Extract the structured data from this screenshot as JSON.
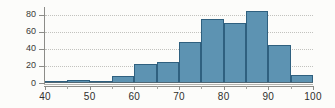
{
  "chart_data": {
    "type": "bar",
    "title": "",
    "subtitle": "",
    "xlabel": "",
    "ylabel": "",
    "xlim": [
      40,
      100
    ],
    "ylim": [
      0,
      88
    ],
    "grid": true,
    "legend": null,
    "bin_width": 5,
    "bin_edges": [
      40,
      45,
      50,
      55,
      60,
      65,
      70,
      75,
      80,
      85,
      90,
      95,
      100
    ],
    "categories": [
      "40-45",
      "45-50",
      "50-55",
      "55-60",
      "60-65",
      "65-70",
      "70-75",
      "75-80",
      "80-85",
      "85-90",
      "90-95",
      "95-100"
    ],
    "values": [
      1,
      3,
      1,
      8,
      22,
      25,
      48,
      75,
      70,
      85,
      45,
      9
    ],
    "x_ticks": [
      40,
      50,
      60,
      70,
      80,
      90,
      100
    ],
    "x_tick_labels": [
      "40",
      "50",
      "60",
      "70",
      "80",
      "90",
      "100"
    ],
    "x_minor_ticks": [
      45,
      55,
      65,
      75,
      85,
      95
    ],
    "y_ticks": [
      0,
      20,
      40,
      60,
      80
    ],
    "y_tick_labels": [
      "0",
      "20",
      "40",
      "60",
      "80"
    ],
    "gridlines": [
      20,
      40,
      60,
      80
    ],
    "colors": {
      "bar_fill": "#5d93b2",
      "bar_edge": "#2f607f",
      "gridline": "#b9b9b4",
      "axis": "#8c8c88",
      "text": "#2f2f2d",
      "background": "#fcfcfa"
    }
  }
}
